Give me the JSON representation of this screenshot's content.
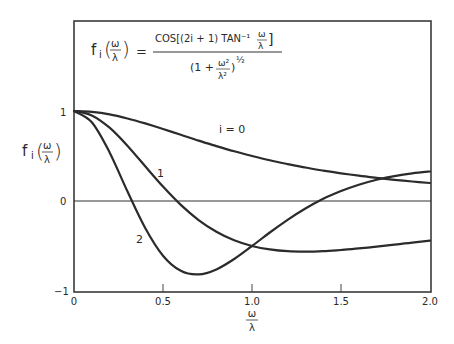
{
  "chart_data": {
    "type": "line",
    "title": "",
    "formula": {
      "lhs": "f_i(ω/λ)",
      "numerator": "cos[(2i + 1) tan⁻¹ ω/λ]",
      "denominator": "(1 + ω²/λ²)^½"
    },
    "xlabel": "ω/λ",
    "ylabel": "f_i(ω/λ)",
    "xlim": [
      0,
      2.0
    ],
    "ylim": [
      -1,
      1
    ],
    "x_ticks": [
      "0",
      "0.5",
      "1.0",
      "1.5",
      "2.0"
    ],
    "y_ticks": [
      "1",
      "0",
      "−1"
    ],
    "grid": false,
    "zero_line": true,
    "x": [
      0,
      0.1,
      0.2,
      0.3,
      0.4,
      0.5,
      0.6,
      0.7,
      0.8,
      0.9,
      1.0,
      1.1,
      1.2,
      1.3,
      1.4,
      1.5,
      1.6,
      1.7,
      1.8,
      1.9,
      2.0
    ],
    "series": [
      {
        "name": "i = 0",
        "label": "i = 0",
        "values": [
          1.0,
          0.99,
          0.962,
          0.917,
          0.862,
          0.8,
          0.735,
          0.671,
          0.61,
          0.552,
          0.5,
          0.452,
          0.41,
          0.372,
          0.338,
          0.308,
          0.281,
          0.257,
          0.236,
          0.217,
          0.2
        ]
      },
      {
        "name": "i = 1",
        "label": "1",
        "values": [
          1.0,
          0.951,
          0.814,
          0.614,
          0.386,
          0.16,
          -0.043,
          -0.212,
          -0.342,
          -0.437,
          -0.5,
          -0.538,
          -0.558,
          -0.562,
          -0.557,
          -0.544,
          -0.527,
          -0.507,
          -0.485,
          -0.463,
          -0.44
        ]
      },
      {
        "name": "i = 2",
        "label": "2",
        "values": [
          1.0,
          0.874,
          0.54,
          0.108,
          -0.3,
          -0.608,
          -0.776,
          -0.816,
          -0.76,
          -0.644,
          -0.5,
          -0.35,
          -0.209,
          -0.083,
          0.024,
          0.111,
          0.181,
          0.235,
          0.277,
          0.307,
          0.328
        ]
      }
    ],
    "annotations": [
      {
        "text": "i = 0",
        "x": 0.95,
        "y": 0.7
      },
      {
        "text": "1",
        "x": 0.5,
        "y": 0.3
      },
      {
        "text": "2",
        "x": 0.3,
        "y": -0.45
      }
    ]
  },
  "labels": {
    "formula_lhs": "f",
    "formula_sub": "i",
    "formula_eq": "=",
    "formula_num": "COS[(2i + 1) TAN⁻¹",
    "formula_den_1": "(1 +",
    "formula_den_2": ")",
    "formula_den_exp": "½",
    "omega": "ω",
    "lambda": "λ",
    "omega2": "ω²",
    "lambda2": "λ²",
    "ylabel_f": "f",
    "ylabel_i": "i",
    "xtick_0": "0",
    "xtick_1": "0.5",
    "xtick_2": "1.0",
    "xtick_3": "1.5",
    "xtick_4": "2.0",
    "ytick_0": "1",
    "ytick_1": "0",
    "ytick_2": "−1",
    "curve0": "i = 0",
    "curve1": "1",
    "curve2": "2"
  }
}
